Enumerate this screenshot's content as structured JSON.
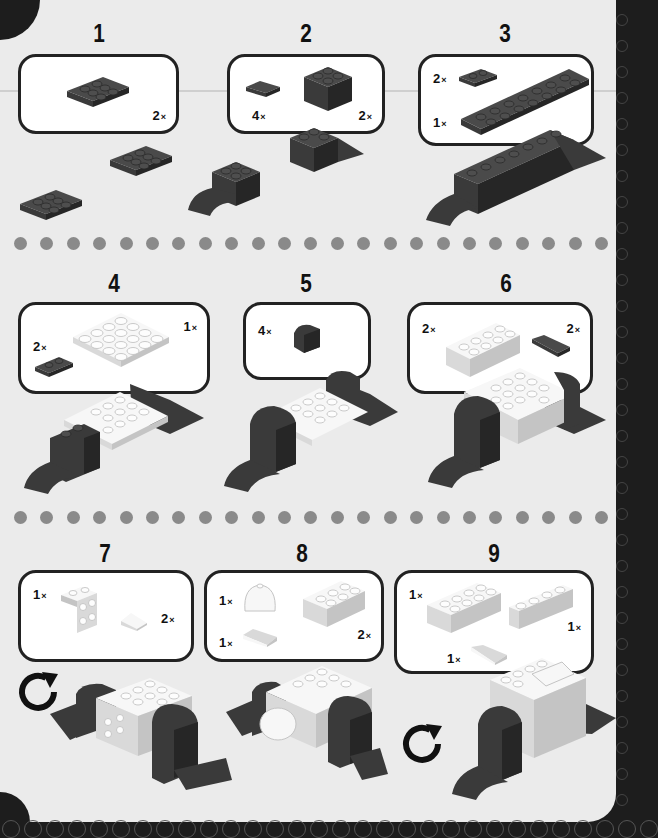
{
  "page": {
    "background_color": "#ebebeb",
    "border_color": "#1d1d1d",
    "separator_dot_color": "#8a8a8a"
  },
  "steps": [
    {
      "number": "1",
      "parts": [
        {
          "qty": "2",
          "part": "dark-2x3-plate"
        }
      ]
    },
    {
      "number": "2",
      "parts": [
        {
          "qty": "4",
          "part": "dark-1x2-curved-slope"
        },
        {
          "qty": "2",
          "part": "dark-2x2-brick"
        }
      ]
    },
    {
      "number": "3",
      "parts": [
        {
          "qty": "2",
          "part": "dark-1x2-plate"
        },
        {
          "qty": "1",
          "part": "dark-2x8-plate"
        }
      ]
    },
    {
      "number": "4",
      "parts": [
        {
          "qty": "2",
          "part": "dark-1x2-plate"
        },
        {
          "qty": "1",
          "part": "white-4x4-plate"
        }
      ]
    },
    {
      "number": "5",
      "parts": [
        {
          "qty": "4",
          "part": "dark-1x1-bracket"
        }
      ]
    },
    {
      "number": "6",
      "parts": [
        {
          "qty": "2",
          "part": "white-2x4-brick"
        },
        {
          "qty": "2",
          "part": "dark-1x2-curved-slope"
        }
      ]
    },
    {
      "number": "7",
      "parts": [
        {
          "qty": "1",
          "part": "white-2x2-bracket"
        },
        {
          "qty": "2",
          "part": "white-1x1-slope"
        }
      ],
      "rotate_hint": "rotate-model"
    },
    {
      "number": "8",
      "parts": [
        {
          "qty": "1",
          "part": "white-dome"
        },
        {
          "qty": "1",
          "part": "white-1x2-slope"
        },
        {
          "qty": "2",
          "part": "white-2x3-brick"
        }
      ]
    },
    {
      "number": "9",
      "parts": [
        {
          "qty": "1",
          "part": "white-2x4-brick"
        },
        {
          "qty": "1",
          "part": "white-1x4-brick"
        },
        {
          "qty": "1",
          "part": "white-1x2-curved-slope"
        }
      ],
      "rotate_hint": "rotate-model"
    }
  ],
  "multiplier_symbol": "×",
  "separators": [
    {
      "dots": 23
    },
    {
      "dots": 23
    }
  ]
}
